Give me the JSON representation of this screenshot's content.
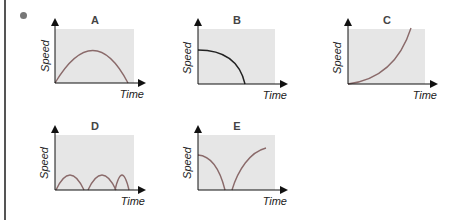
{
  "graphs": [
    {
      "id": "A",
      "title": "A",
      "xlabel": "Time",
      "ylabel": "Speed",
      "shape": "single arch rising from zero and returning to zero"
    },
    {
      "id": "B",
      "title": "B",
      "xlabel": "Time",
      "ylabel": "Speed",
      "shape": "starts at mid-high speed, decreases slowly then steeply to zero"
    },
    {
      "id": "C",
      "title": "C",
      "xlabel": "Time",
      "ylabel": "Speed",
      "shape": "starts at zero, increases with growing slope"
    },
    {
      "id": "D",
      "title": "D",
      "xlabel": "Time",
      "ylabel": "Speed",
      "shape": "three small arches returning to zero"
    },
    {
      "id": "E",
      "title": "E",
      "xlabel": "Time",
      "ylabel": "Speed",
      "shape": "decreases from mid-high to zero then rises again"
    }
  ],
  "colors": {
    "plot_bg": "#e6e6e6",
    "curve": "#8a6a6a",
    "curve_dark": "#222222",
    "axis": "#111111",
    "bullet": "#777777"
  }
}
